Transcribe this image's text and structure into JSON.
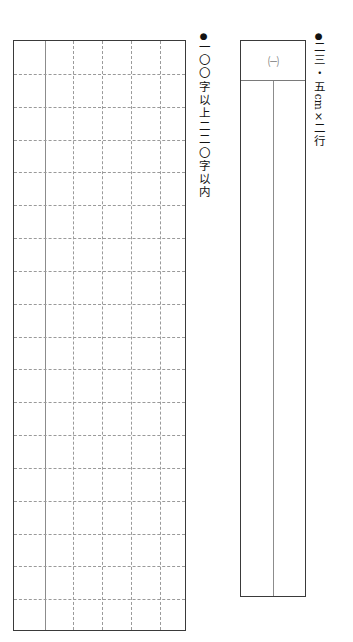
{
  "document": {
    "type": "japanese-exam-answer-sheet",
    "language": "ja"
  },
  "manuscript_grid": {
    "name": "genkou-youshi-grid",
    "columns": 6,
    "rows": 18,
    "solid_column_rules": 1,
    "border_color": "#3a3a3a",
    "rule_color": "#9a9a9a"
  },
  "notes": [
    {
      "id": "char-count",
      "bullet": "●",
      "text": "一〇〇字以上二二〇字以内"
    },
    {
      "id": "dimensions",
      "bullet": "●",
      "text_before": "二三・五",
      "text_latin": "cm",
      "text_mid": "×",
      "text_after": "二行"
    }
  ],
  "answer_box": {
    "name": "answer-box",
    "header_label": "㈠",
    "columns": 2,
    "border_color": "#3a3a3a",
    "divider_color": "#8c8c8c"
  }
}
